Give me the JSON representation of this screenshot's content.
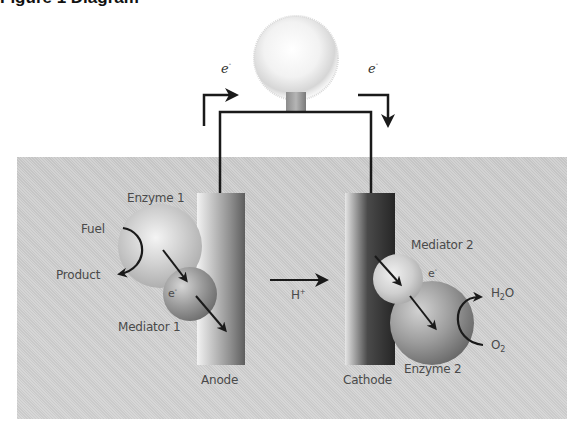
{
  "figure": {
    "caption_fragment": "Figure 1 Diagram",
    "colors": {
      "background_panel": "#cfcfcf",
      "wire": "#1a1a1a",
      "anode_light": "#dcdcdc",
      "anode_dark": "#6e6e6e",
      "cathode_dark": "#2e2e2e",
      "text": "#4a4a4a"
    }
  },
  "circuit": {
    "bulb_icon": "light-bulb",
    "electron_left": {
      "label": "e",
      "charge": "-",
      "direction": "right"
    },
    "electron_right": {
      "label": "e",
      "charge": "-",
      "direction": "down"
    }
  },
  "anode_side": {
    "electrode_label": "Anode",
    "enzyme_label": "Enzyme 1",
    "mediator_label": "Mediator 1",
    "fuel_label": "Fuel",
    "product_label": "Product",
    "electron_label": "e",
    "electron_charge": "-"
  },
  "proton": {
    "label": "H",
    "charge": "+"
  },
  "cathode_side": {
    "electrode_label": "Cathode",
    "enzyme_label": "Enzyme 2",
    "mediator_label": "Mediator 2",
    "electron_label": "e",
    "electron_charge": "-",
    "reactant": {
      "base": "O",
      "sub": "2"
    },
    "product": {
      "pre": "H",
      "sub": "2",
      "post": "O"
    }
  }
}
